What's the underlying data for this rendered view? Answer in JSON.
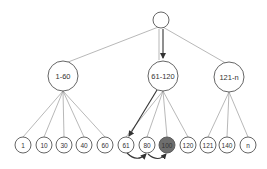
{
  "diagram": {
    "type": "tree",
    "root": {
      "label": "",
      "x": 161,
      "y": 20,
      "r": 8
    },
    "mid_nodes": [
      {
        "label": "1-60",
        "x": 63,
        "y": 76,
        "r": 15
      },
      {
        "label": "61-120",
        "x": 163,
        "y": 76,
        "r": 15
      },
      {
        "label": "121-n",
        "x": 229,
        "y": 77,
        "r": 15
      }
    ],
    "leaves": [
      {
        "label": "1",
        "x": 23,
        "parent": 0
      },
      {
        "label": "10",
        "x": 44,
        "parent": 0
      },
      {
        "label": "30",
        "x": 64,
        "parent": 0
      },
      {
        "label": "40",
        "x": 84,
        "parent": 0
      },
      {
        "label": "60",
        "x": 105,
        "parent": 0
      },
      {
        "label": "61",
        "x": 126,
        "parent": 1
      },
      {
        "label": "80",
        "x": 147,
        "parent": 1
      },
      {
        "label": "100",
        "x": 167,
        "parent": 1,
        "highlight": true
      },
      {
        "label": "120",
        "x": 188,
        "parent": 1
      },
      {
        "label": "121",
        "x": 208,
        "parent": 2
      },
      {
        "label": "140",
        "x": 227,
        "parent": 2
      },
      {
        "label": "n",
        "x": 248,
        "parent": 2
      }
    ],
    "leaf_y": 145,
    "leaf_r": 8,
    "colors": {
      "highlight_fill": "#6e6e6e",
      "edge": "#9a9a9a",
      "node_stroke": "#555555",
      "arrow": "#333333"
    }
  }
}
